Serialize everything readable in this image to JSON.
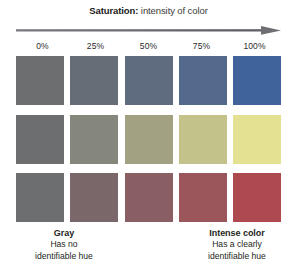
{
  "figure": {
    "title": {
      "lead": "Saturation:",
      "sub": " intensity of color"
    },
    "axis": {
      "direction": "left-to-right",
      "arrow_color": "#6e6e73"
    },
    "ticks": [
      "0%",
      "25%",
      "50%",
      "75%",
      "100%"
    ],
    "rows": [
      {
        "name": "blue-row",
        "hue": "blue",
        "swatches": [
          {
            "label": "0%",
            "color": "#6d6e70"
          },
          {
            "label": "25%",
            "color": "#676d77"
          },
          {
            "label": "50%",
            "color": "#5f6c7f"
          },
          {
            "label": "75%",
            "color": "#546a8c"
          },
          {
            "label": "100%",
            "color": "#41639c"
          }
        ]
      },
      {
        "name": "yellow-green-row",
        "hue": "yellow-green",
        "swatches": [
          {
            "label": "0%",
            "color": "#6d6e70"
          },
          {
            "label": "25%",
            "color": "#85867c"
          },
          {
            "label": "50%",
            "color": "#a2a283"
          },
          {
            "label": "75%",
            "color": "#c3c28b"
          },
          {
            "label": "100%",
            "color": "#e4e193"
          }
        ]
      },
      {
        "name": "red-row",
        "hue": "red",
        "swatches": [
          {
            "label": "0%",
            "color": "#6d6e70"
          },
          {
            "label": "25%",
            "color": "#7a676a"
          },
          {
            "label": "50%",
            "color": "#8a5f63"
          },
          {
            "label": "75%",
            "color": "#9a565b"
          },
          {
            "label": "100%",
            "color": "#ad4a50"
          }
        ]
      }
    ],
    "captions": {
      "left": {
        "head": "Gray",
        "line1": "Has no",
        "line2": "identifiable hue"
      },
      "right": {
        "head": "Intense color",
        "line1": "Has a clearly",
        "line2": "identifiable hue"
      }
    }
  }
}
